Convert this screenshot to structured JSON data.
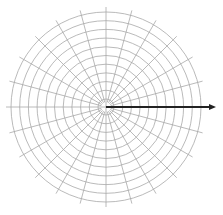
{
  "diagram": {
    "type": "polar-grid",
    "center": [
      106,
      107
    ],
    "outer_radius": 95,
    "inner_radius": 8,
    "ring_count": 10,
    "spoke_count": 24,
    "spoke_angle_step_deg": 15,
    "spoke_extension": 5,
    "grid_color": "#a8a8a8",
    "vector": {
      "from": [
        106,
        107
      ],
      "to": [
        216,
        107
      ],
      "angle_deg": 0,
      "color": "#222222"
    }
  }
}
